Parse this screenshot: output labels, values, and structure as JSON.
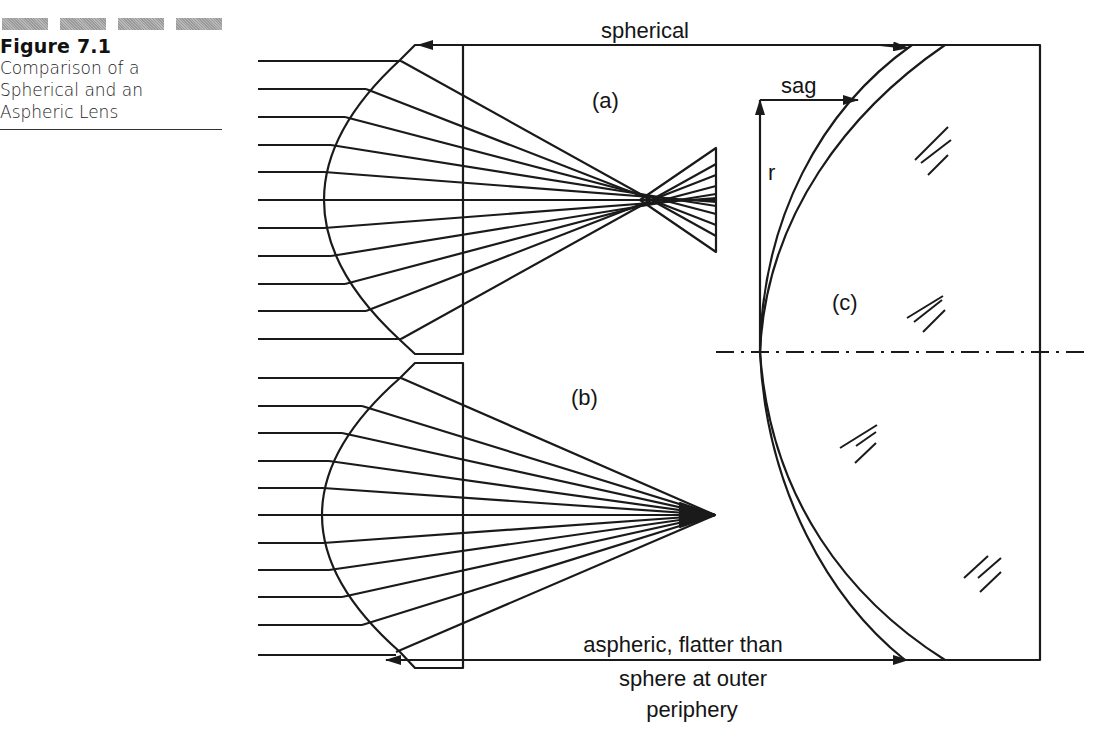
{
  "caption": {
    "bars": 4,
    "figure_number": "Figure 7.1",
    "lines": [
      "Comparison of a",
      "Spherical and an",
      "Aspheric Lens"
    ]
  },
  "diagram": {
    "labels": {
      "spherical": "spherical",
      "part_a": "(a)",
      "part_b": "(b)",
      "part_c": "(c)",
      "sag": "sag",
      "r": "r",
      "aspheric_line1": "aspheric, flatter than",
      "aspheric_line2": "sphere at outer",
      "aspheric_line3": "periphery"
    },
    "ray_count_per_lens": 11,
    "hatch_marks": 4,
    "line_color": "#1a1a1a",
    "background": "#ffffff"
  }
}
